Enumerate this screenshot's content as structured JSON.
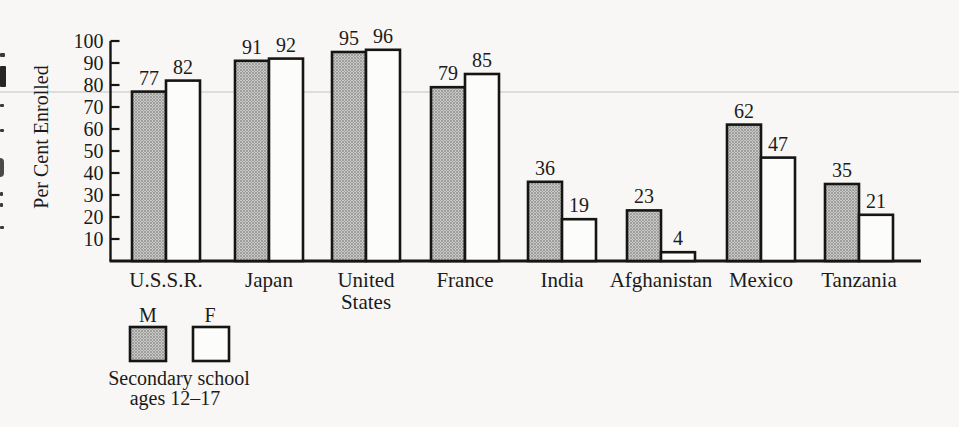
{
  "page": {
    "background_color": "#f8f7f5"
  },
  "chart_data": {
    "type": "bar",
    "title": "",
    "ylabel": "Per Cent Enrolled",
    "xlabel": "",
    "ylim": [
      0,
      100
    ],
    "yticks": [
      10,
      20,
      30,
      40,
      50,
      60,
      70,
      80,
      90,
      100
    ],
    "grid": false,
    "categories": [
      "U.S.S.R.",
      "Japan",
      "United States",
      "France",
      "India",
      "Afghanistan",
      "Mexico",
      "Tanzania"
    ],
    "series": [
      {
        "name": "M",
        "swatch": "halftone-gray",
        "values": [
          77,
          91,
          95,
          79,
          36,
          23,
          62,
          35
        ]
      },
      {
        "name": "F",
        "swatch": "white",
        "values": [
          82,
          92,
          96,
          85,
          19,
          4,
          47,
          21
        ]
      }
    ],
    "value_labels": true,
    "legend": {
      "position": "bottom-left",
      "entries": [
        {
          "label": "M",
          "swatch": "halftone-gray"
        },
        {
          "label": "F",
          "swatch": "white"
        }
      ],
      "caption_lines": [
        "Secondary school",
        "ages 12–17"
      ]
    },
    "colors": {
      "bar_outline": "#151513",
      "text": "#1b1b1b",
      "halftone_base": "#c9c9c7",
      "halftone_dot": "#8d8d8b",
      "white_bar": "#fcfcfb",
      "axis": "#151513"
    }
  }
}
